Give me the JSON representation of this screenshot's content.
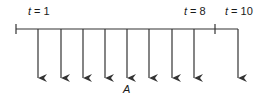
{
  "diagram": {
    "type": "cash-flow-timeline",
    "labels": {
      "t_start": {
        "var": "t",
        "eq": " = ",
        "val": "1"
      },
      "t_mid": {
        "var": "t",
        "eq": " = ",
        "val": "8"
      },
      "t_end": {
        "var": "t",
        "eq": " = ",
        "val": "10"
      },
      "payment": "A"
    },
    "arrows": [
      {
        "period": 1
      },
      {
        "period": 2
      },
      {
        "period": 3
      },
      {
        "period": 4
      },
      {
        "period": 5
      },
      {
        "period": 6
      },
      {
        "period": 7
      },
      {
        "period": 8
      },
      {
        "period": 10
      }
    ],
    "colors": {
      "line": "#333333",
      "text": "#1a1a1a"
    }
  }
}
